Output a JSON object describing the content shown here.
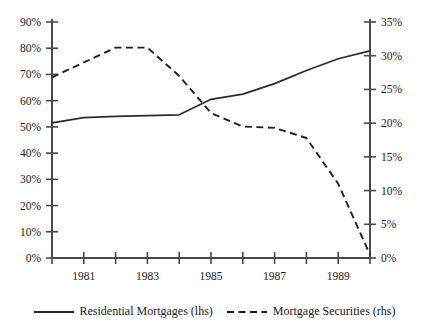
{
  "chart_data": {
    "type": "line",
    "title": "",
    "subtitle": "",
    "xlabel": "",
    "ylabel": "",
    "grid": false,
    "legend_position": "bottom",
    "x": [
      1980,
      1981,
      1982,
      1983,
      1984,
      1985,
      1986,
      1987,
      1988,
      1989,
      1990
    ],
    "xtick_labels": [
      "",
      "1981",
      "",
      "1983",
      "",
      "1985",
      "",
      "1987",
      "",
      "1989",
      ""
    ],
    "left_axis": {
      "label": "",
      "ylim": [
        0,
        90
      ],
      "ticks": [
        0,
        10,
        20,
        30,
        40,
        50,
        60,
        70,
        80,
        90
      ],
      "tick_labels": [
        "0%",
        "10%",
        "20%",
        "30%",
        "40%",
        "50%",
        "60%",
        "70%",
        "80%",
        "90%"
      ]
    },
    "right_axis": {
      "label": "",
      "ylim": [
        0,
        35
      ],
      "ticks": [
        0,
        5,
        10,
        15,
        20,
        25,
        30,
        35
      ],
      "tick_labels": [
        "0%",
        "5%",
        "10%",
        "15%",
        "20%",
        "25%",
        "30%",
        "35%"
      ]
    },
    "series": [
      {
        "name": "Residential Mortgages (lhs)",
        "axis": "left",
        "style": "solid",
        "color": "#2b2b2b",
        "values": [
          51.5,
          53.5,
          54.0,
          54.3,
          54.6,
          60.5,
          62.5,
          66.5,
          71.5,
          76.0,
          79.0
        ]
      },
      {
        "name": "Mortgage Securities (rhs)",
        "axis": "right",
        "style": "dashed",
        "color": "#1f1f1f",
        "values": [
          26.8,
          29.0,
          31.2,
          31.2,
          27.0,
          21.5,
          19.5,
          19.3,
          17.8,
          11.0,
          0.5
        ]
      }
    ]
  },
  "legend": {
    "items": [
      {
        "label": "Residential Mortgages (lhs)",
        "style": "solid"
      },
      {
        "label": "Mortgage Securities (rhs)",
        "style": "dashed"
      }
    ]
  }
}
